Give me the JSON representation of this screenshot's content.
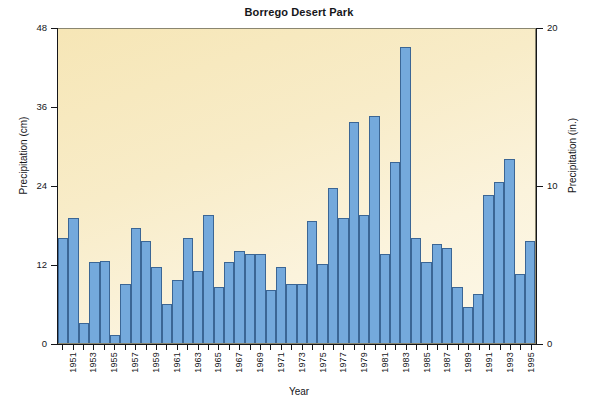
{
  "chart_data": {
    "type": "bar",
    "title": "Borrego Desert Park",
    "xlabel": "Year",
    "ylabel": "Precipitation (cm)",
    "ylabel_right": "Precipitation (in.)",
    "ylim": [
      0,
      48
    ],
    "ylim_right": [
      0,
      20
    ],
    "yticks": [
      0,
      12,
      24,
      36,
      48
    ],
    "yticks_right": [
      0,
      10,
      20
    ],
    "grid": false,
    "legend": "none",
    "bar_color": "#74a9dc",
    "bar_edge_color": "#3b6695",
    "plot_background": "#f8ecc8",
    "categories": [
      "1950",
      "1951",
      "1952",
      "1953",
      "1954",
      "1955",
      "1956",
      "1957",
      "1958",
      "1959",
      "1960",
      "1961",
      "1962",
      "1963",
      "1964",
      "1965",
      "1966",
      "1967",
      "1968",
      "1969",
      "1970",
      "1971",
      "1972",
      "1973",
      "1974",
      "1975",
      "1976",
      "1977",
      "1978",
      "1979",
      "1980",
      "1981",
      "1982",
      "1983",
      "1984",
      "1985",
      "1986",
      "1987",
      "1988",
      "1989",
      "1990",
      "1991",
      "1992",
      "1993",
      "1994",
      "1995"
    ],
    "values": [
      16.0,
      19.0,
      3.0,
      12.3,
      12.5,
      1.2,
      9.0,
      17.5,
      15.5,
      11.5,
      6.0,
      9.5,
      16.0,
      11.0,
      19.5,
      8.5,
      12.3,
      14.0,
      13.5,
      13.5,
      8.0,
      11.5,
      9.0,
      9.0,
      18.5,
      12.0,
      23.5,
      19.0,
      33.5,
      19.5,
      34.5,
      13.5,
      27.5,
      45.0,
      16.0,
      12.3,
      15.0,
      14.5,
      8.5,
      5.5,
      7.5,
      22.5,
      24.5,
      28.0,
      10.5,
      15.5
    ],
    "tick_labels": [
      "1951",
      "1953",
      "1955",
      "1957",
      "1959",
      "1961",
      "1963",
      "1965",
      "1967",
      "1969",
      "1971",
      "1973",
      "1975",
      "1977",
      "1979",
      "1981",
      "1983",
      "1985",
      "1987",
      "1989",
      "1991",
      "1993",
      "1995"
    ]
  }
}
